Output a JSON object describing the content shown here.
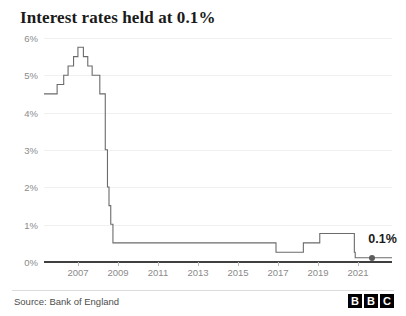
{
  "chart": {
    "title": "Interest rates held at 0.1%",
    "source": "Source: Bank of England",
    "brand": "BBC",
    "brand_letters": [
      "B",
      "B",
      "C"
    ],
    "annotation_label": "0.1%",
    "colors": {
      "line": "#6b6b6b",
      "axis": "#3f3f3f",
      "grid": "#f0f0f0",
      "tick_text": "#8b8b8b",
      "title_text": "#1a1a1a",
      "marker": "#5c5c5c",
      "background": "#ffffff"
    }
  },
  "chart_data": {
    "type": "line",
    "title": "Interest rates held at 0.1%",
    "xlabel": "",
    "ylabel": "",
    "xlim": [
      2006.0,
      2021.9
    ],
    "ylim": [
      0,
      6
    ],
    "grid": true,
    "legend": false,
    "step": "post",
    "y_ticks": [
      "0%",
      "1%",
      "2%",
      "3%",
      "4%",
      "5%",
      "6%"
    ],
    "y_tick_values": [
      0,
      1,
      2,
      3,
      4,
      5,
      6
    ],
    "x_ticks": [
      "2007",
      "2009",
      "2011",
      "2013",
      "2015",
      "2017",
      "2019",
      "2021"
    ],
    "x_tick_values": [
      2007,
      2009,
      2011,
      2013,
      2015,
      2017,
      2019,
      2021
    ],
    "series": [
      {
        "name": "Bank of England Bank Rate",
        "x": [
          2006.0,
          2006.6,
          2006.9,
          2007.1,
          2007.35,
          2007.55,
          2007.8,
          2008.0,
          2008.2,
          2008.55,
          2008.8,
          2008.9,
          2008.97,
          2009.05,
          2009.15,
          2009.25,
          2016.6,
          2017.85,
          2018.6,
          2020.18,
          2020.22,
          2021.85
        ],
        "y": [
          4.5,
          4.75,
          5.0,
          5.25,
          5.5,
          5.75,
          5.5,
          5.25,
          5.0,
          4.5,
          3.0,
          2.0,
          1.5,
          1.0,
          0.5,
          0.5,
          0.25,
          0.5,
          0.75,
          0.25,
          0.1,
          0.1
        ]
      }
    ],
    "annotations": [
      {
        "label": "0.1%",
        "x": 2021.0,
        "y": 0.1,
        "marker": "circle"
      }
    ]
  }
}
